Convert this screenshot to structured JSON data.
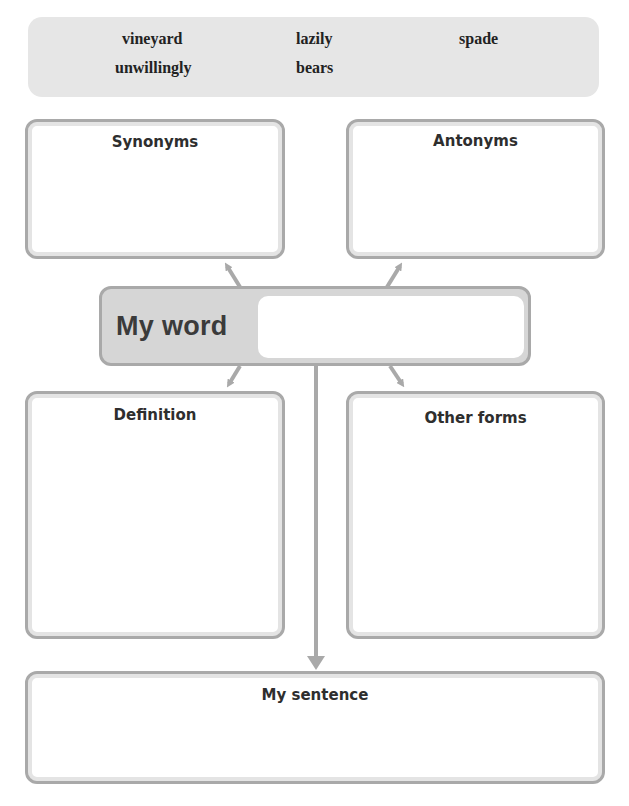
{
  "header_fragment": "Vocabulary",
  "word_bank": {
    "words": [
      "vineyard",
      "lazily",
      "spade",
      "unwillingly",
      "bears"
    ]
  },
  "organizer": {
    "synonyms": {
      "title": "Synonyms",
      "value": ""
    },
    "antonyms": {
      "title": "Antonyms",
      "value": ""
    },
    "my_word": {
      "label": "My word",
      "value": ""
    },
    "definition": {
      "title": "Definition",
      "value": ""
    },
    "other_forms": {
      "title": "Other forms",
      "value": ""
    },
    "my_sentence": {
      "title": "My sentence",
      "value": ""
    }
  },
  "colors": {
    "banner_bg": "#e6e6e6",
    "box_border": "#a9a9a9",
    "box_inner_ring": "#e4e4e4",
    "myword_bg": "#d6d6d6",
    "arrow": "#a9a9a9",
    "text": "#2e2e2e"
  }
}
